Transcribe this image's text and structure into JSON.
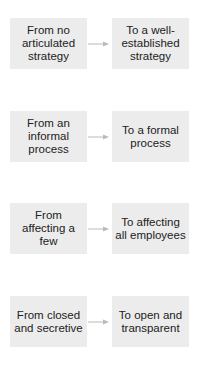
{
  "diagram": {
    "type": "transition-flow",
    "colors": {
      "box_fill": "#ececec",
      "text": "#222222",
      "arrow": "#bbbbbb"
    },
    "rows": [
      {
        "from": "From no articulated strategy",
        "to": "To a well-established strategy",
        "arrow": "arrow-right-icon"
      },
      {
        "from": "From an informal process",
        "to": "To a formal process",
        "arrow": "arrow-right-icon"
      },
      {
        "from": "From affecting a few",
        "to": "To affecting all employees",
        "arrow": "arrow-right-icon"
      },
      {
        "from": "From closed and secretive",
        "to": "To open and transparent",
        "arrow": "arrow-right-icon"
      }
    ]
  }
}
